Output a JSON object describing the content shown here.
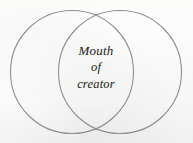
{
  "figure": {
    "type": "venn-diagram",
    "set_count": 2,
    "background_color": "#fbfbfa",
    "stroke_color": "#8f8f8f",
    "stroke_width": 1.1,
    "text_color": "#1d1b19",
    "circles": [
      {
        "name": "left-circle",
        "cx": 72,
        "cy": 72,
        "r": 61.5
      },
      {
        "name": "right-circle",
        "cx": 120,
        "cy": 72,
        "r": 61.5
      }
    ],
    "intersection_label": {
      "lines": [
        "Mouth",
        "of",
        "creator"
      ]
    }
  }
}
